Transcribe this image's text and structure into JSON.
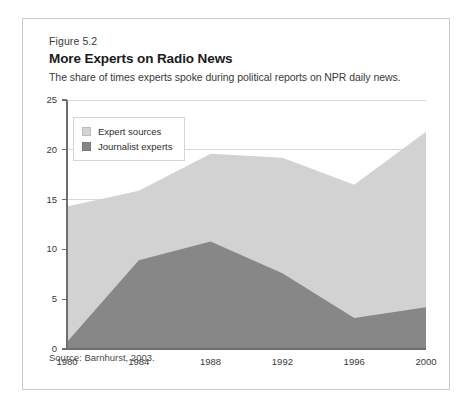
{
  "figure": {
    "number": "Figure 5.2",
    "title": "More Experts on Radio News",
    "subtitle": "The share of times experts spoke during political reports on NPR daily news.",
    "source": "Source: Barnhurst, 2003."
  },
  "colors": {
    "expert_sources": "#d2d2d2",
    "journalist_experts": "#878787",
    "axis": "#6e6e6e",
    "gridline": "#d8d8d8",
    "border": "#c9c9c9",
    "text": "#231f20"
  },
  "chart_data": {
    "type": "area",
    "stacked": false,
    "title": "More Experts on Radio News",
    "subtitle": "The share of times experts spoke during political reports on NPR daily news.",
    "xlabel": "",
    "ylabel": "",
    "x": [
      1980,
      1984,
      1988,
      1992,
      1996,
      2000
    ],
    "categories": [
      "1980",
      "1984",
      "1988",
      "1992",
      "1996",
      "2000"
    ],
    "xlim": [
      1980,
      2000
    ],
    "ylim": [
      0,
      25
    ],
    "yticks": [
      0,
      5,
      10,
      15,
      20,
      25
    ],
    "ytick_labels": [
      "0",
      "5",
      "10",
      "15",
      "20",
      "25"
    ],
    "xticks": [
      1980,
      1984,
      1988,
      1992,
      1996,
      2000
    ],
    "xtick_labels": [
      "1980",
      "1984",
      "1988",
      "1992",
      "1996",
      "2000"
    ],
    "grid": true,
    "grid_axis": "y",
    "legend_position": "upper left",
    "series": [
      {
        "name": "Expert sources",
        "color": "#d2d2d2",
        "values": [
          14.3,
          15.9,
          19.6,
          19.2,
          16.5,
          21.8
        ]
      },
      {
        "name": "Journalist experts",
        "color": "#878787",
        "values": [
          0.7,
          8.9,
          10.8,
          7.6,
          3.1,
          4.2
        ]
      }
    ],
    "source": "Source: Barnhurst, 2003."
  }
}
